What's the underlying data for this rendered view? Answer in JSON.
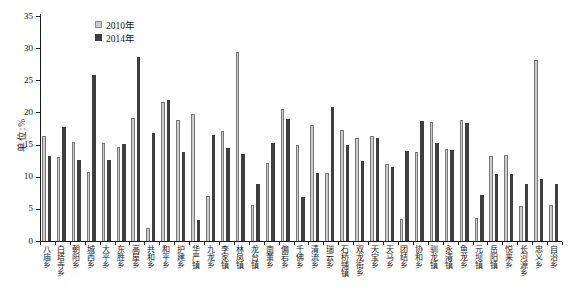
{
  "chart_data": {
    "type": "bar",
    "title": "",
    "ylabel": "单位:%",
    "xlabel": "",
    "ylim": [
      0,
      35
    ],
    "yticks": [
      0,
      5,
      10,
      15,
      20,
      25,
      30,
      35
    ],
    "grid": false,
    "legend_position": "top-left-inside",
    "categories": [
      "八庙乡",
      "白塔寺乡",
      "朝阳乡",
      "城西乡",
      "大平乡",
      "东胜乡",
      "高屋乡",
      "共和乡",
      "和平乡",
      "护建乡",
      "华严镇",
      "九龙乡",
      "李家镇",
      "林凤镇",
      "龙台镇",
      "南薰乡",
      "偏岩乡",
      "千佛乡",
      "清流乡",
      "瑞云乡",
      "石桥铺镇",
      "双龙街乡",
      "天宝乡",
      "天马乡",
      "团结乡",
      "协和乡",
      "驯龙镇",
      "永清镇",
      "鱼龙乡",
      "元坝镇",
      "岳阳镇",
      "悦来乡",
      "长河源乡",
      "忠义乡",
      "自治乡"
    ],
    "series": [
      {
        "name": "2010年",
        "color": "#cccccc",
        "values": [
          16.4,
          13.1,
          15.4,
          10.7,
          15.3,
          14.6,
          19.2,
          2.0,
          21.6,
          18.9,
          19.7,
          7.0,
          17.1,
          29.4,
          5.6,
          12.1,
          20.6,
          15.0,
          18.0,
          10.6,
          17.2,
          16.0,
          16.4,
          12.0,
          3.5,
          13.8,
          18.5,
          14.3,
          18.8,
          3.6,
          13.3,
          13.4,
          5.5,
          28.2,
          5.6
        ]
      },
      {
        "name": "2014年",
        "color": "#3f3f3f",
        "values": [
          13.2,
          17.7,
          12.6,
          25.9,
          12.6,
          15.1,
          28.7,
          16.8,
          22.0,
          13.9,
          3.3,
          16.5,
          14.5,
          13.5,
          8.9,
          15.2,
          19.0,
          6.8,
          10.6,
          20.9,
          15.0,
          12.4,
          16.0,
          11.5,
          14.0,
          18.7,
          15.2,
          14.2,
          18.4,
          7.1,
          10.4,
          10.5,
          8.8,
          9.7,
          8.9
        ]
      }
    ]
  }
}
